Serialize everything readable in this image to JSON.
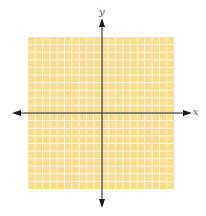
{
  "chart_data": {
    "type": "coordinate-grid",
    "title": "",
    "xlabel": "x",
    "ylabel": "y",
    "grid": true,
    "columns": 20,
    "rows": 20,
    "xlim": [
      -10,
      10
    ],
    "ylim": [
      -10,
      10
    ],
    "tick_labels": [],
    "series": []
  },
  "axes": {
    "x_label": "x",
    "y_label": "y"
  },
  "colors": {
    "grid_fill": "#F8DD95",
    "grid_line": "#FDF3D6",
    "axis": "#1a1a1a",
    "label": "#555555"
  }
}
